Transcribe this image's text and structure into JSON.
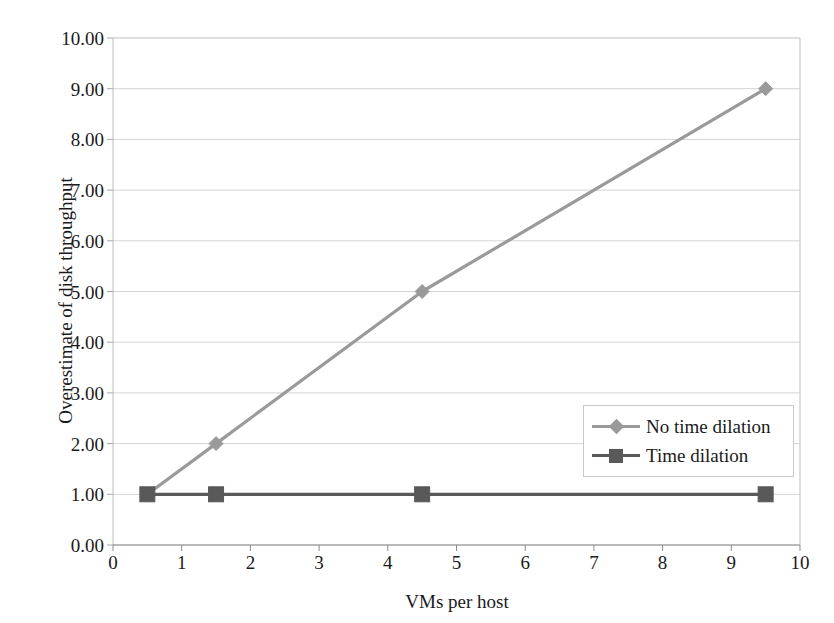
{
  "chart_data": {
    "type": "line",
    "title": "",
    "xlabel": "VMs per host",
    "ylabel": "Overestimate of disk throughput",
    "xlim": [
      0,
      10
    ],
    "ylim": [
      0,
      10
    ],
    "grid": "horizontal",
    "legend_position": "inside-right-middle",
    "x_ticks": [
      "0",
      "1",
      "2",
      "3",
      "4",
      "5",
      "6",
      "7",
      "8",
      "9",
      "10"
    ],
    "x_tick_values": [
      0,
      1,
      2,
      3,
      4,
      5,
      6,
      7,
      8,
      9,
      10
    ],
    "y_ticks": [
      "0.00",
      "1.00",
      "2.00",
      "3.00",
      "4.00",
      "5.00",
      "6.00",
      "7.00",
      "8.00",
      "9.00",
      "10.00"
    ],
    "y_tick_values": [
      0,
      1,
      2,
      3,
      4,
      5,
      6,
      7,
      8,
      9,
      10
    ],
    "series": [
      {
        "name": "No time dilation",
        "color": "#9a9a9a",
        "marker": "diamond",
        "x": [
          0.5,
          1.5,
          4.5,
          9.5
        ],
        "values": [
          1.0,
          2.0,
          5.0,
          9.0
        ]
      },
      {
        "name": "Time dilation",
        "color": "#595959",
        "marker": "square",
        "x": [
          0.5,
          1.5,
          4.5,
          9.5
        ],
        "values": [
          1.0,
          1.0,
          1.0,
          1.0
        ]
      }
    ]
  },
  "legend": {
    "items": [
      {
        "label": "No time dilation",
        "color": "#9a9a9a",
        "marker": "diamond"
      },
      {
        "label": "Time dilation",
        "color": "#595959",
        "marker": "square"
      }
    ]
  },
  "colors": {
    "no_time_dilation": "#9a9a9a",
    "time_dilation": "#595959",
    "gridline": "#d4d4d4",
    "axis": "#bdbdbd",
    "text": "#1a1a1a",
    "background": "#ffffff"
  }
}
